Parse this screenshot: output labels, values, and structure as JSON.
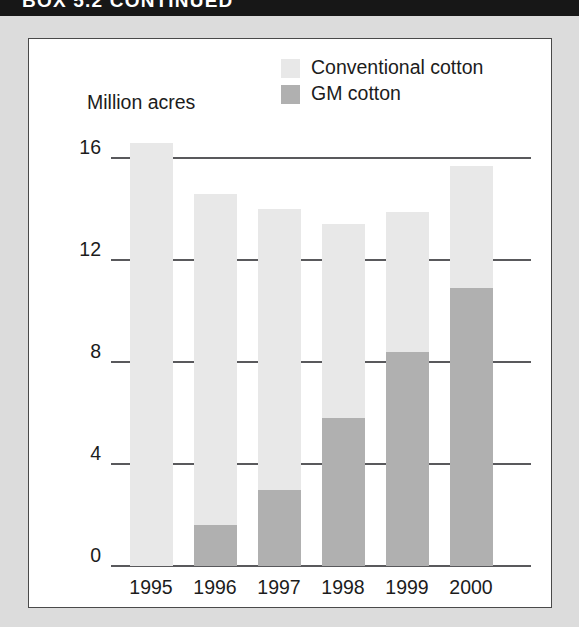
{
  "header": {
    "title": "BOX 5.2 CONTINUED"
  },
  "colors": {
    "conventional": "#e8e8e8",
    "gm": "#b0b0b0",
    "axis": "#59595c",
    "text": "#1c1c1c",
    "header_band": "#171717",
    "page_margin": "#dcdcdc",
    "panel": "#ffffff"
  },
  "legend": {
    "items": [
      {
        "label": "Conventional cotton",
        "swatch": "#e8e8e8"
      },
      {
        "label": "GM cotton",
        "swatch": "#b0b0b0"
      }
    ]
  },
  "chart_data": {
    "type": "bar",
    "title": "",
    "subtitle": "",
    "stacked": true,
    "xlabel": "",
    "ylabel": "Million acres",
    "ylim": [
      0,
      16
    ],
    "yticks": [
      "0",
      "4",
      "8",
      "12",
      "16"
    ],
    "ytick_values": [
      0,
      4,
      8,
      12,
      16
    ],
    "grid": true,
    "legend_position": "top-right",
    "categories": [
      "1995",
      "1996",
      "1997",
      "1998",
      "1999",
      "2000"
    ],
    "series": [
      {
        "name": "GM cotton",
        "color": "#b0b0b0",
        "values": [
          0,
          1.6,
          3.0,
          5.8,
          8.4,
          10.9
        ]
      },
      {
        "name": "Conventional cotton",
        "color": "#e8e8e8",
        "values": [
          16.6,
          13.0,
          11.0,
          7.6,
          5.5,
          4.8
        ]
      }
    ],
    "totals": [
      16.6,
      14.6,
      14.0,
      13.4,
      13.9,
      15.7
    ]
  }
}
